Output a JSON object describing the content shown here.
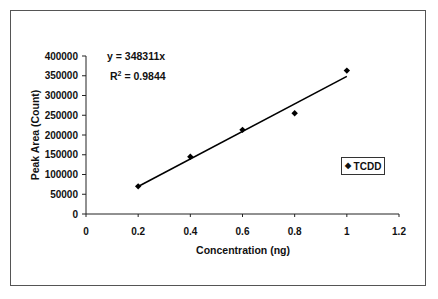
{
  "chart_data": {
    "type": "scatter",
    "title": "",
    "xlabel": "Concentration (ng)",
    "ylabel": "Peak Area (Count)",
    "xlim": [
      0,
      1.2
    ],
    "ylim": [
      0,
      400000
    ],
    "x_ticks": [
      "0",
      "0.2",
      "0.4",
      "0.6",
      "0.8",
      "1",
      "1.2"
    ],
    "y_ticks": [
      "0",
      "50000",
      "100000",
      "150000",
      "200000",
      "250000",
      "300000",
      "350000",
      "400000"
    ],
    "grid": false,
    "legend_position": "right",
    "series": [
      {
        "name": "TCDD",
        "marker": "diamond",
        "x": [
          0.2,
          0.4,
          0.6,
          0.8,
          1.0
        ],
        "y": [
          70000,
          145000,
          213000,
          255000,
          363000
        ]
      }
    ],
    "trendline": {
      "type": "linear",
      "through_origin": true,
      "slope": 348311,
      "x_range": [
        0.2,
        1.0
      ]
    },
    "annotations": {
      "equation": "y = 348311x",
      "r2_prefix": "R",
      "r2_sup": "2",
      "r2_value": " = 0.9844"
    },
    "colors": {
      "series": "#000000",
      "frame": "#555555"
    }
  },
  "legend": {
    "marker": "◆",
    "label": "TCDD"
  }
}
